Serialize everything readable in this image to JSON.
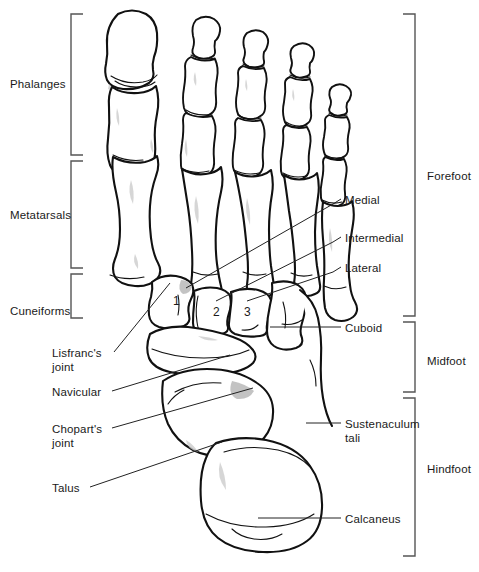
{
  "figure": {
    "view": "dorsal",
    "line_color": "#1a1a1a",
    "bone_fill": "#ffffff",
    "shading_color": "#b0b0b0",
    "background": "#ffffff"
  },
  "region_brackets_left": [
    {
      "label": "Phalanges",
      "name": "bracket-phalanges",
      "side": "left",
      "y_top": 14,
      "y_bottom": 155,
      "label_y": 78
    },
    {
      "label": "Metatarsals",
      "name": "bracket-metatarsals",
      "side": "left",
      "y_top": 161,
      "y_bottom": 268,
      "label_y": 209
    },
    {
      "label": "Cuneiforms",
      "name": "bracket-cuneiforms",
      "side": "left",
      "y_top": 274,
      "y_bottom": 318,
      "label_y": 305
    }
  ],
  "region_brackets_right": [
    {
      "label": "Forefoot",
      "name": "bracket-forefoot",
      "side": "right",
      "y_top": 14,
      "y_bottom": 316,
      "label_y": 170
    },
    {
      "label": "Midfoot",
      "name": "bracket-midfoot",
      "side": "right",
      "y_top": 322,
      "y_bottom": 392,
      "label_y": 355
    },
    {
      "label": "Hindfoot",
      "name": "bracket-hindfoot",
      "side": "right",
      "y_top": 398,
      "y_bottom": 556,
      "label_y": 463
    }
  ],
  "callouts_right": [
    {
      "label": "Medial",
      "name": "callout-medial",
      "text_x": 345,
      "text_y": 194,
      "leader": [
        [
          341,
          199
        ],
        [
          333,
          204
        ],
        [
          186,
          288
        ]
      ]
    },
    {
      "label": "Intermedial",
      "name": "callout-intermedial",
      "text_x": 345,
      "text_y": 232,
      "leader": [
        [
          341,
          237
        ],
        [
          333,
          242
        ],
        [
          216,
          301
        ]
      ]
    },
    {
      "label": "Lateral",
      "name": "callout-lateral",
      "text_x": 345,
      "text_y": 262,
      "leader": [
        [
          341,
          267
        ],
        [
          333,
          272
        ],
        [
          247,
          301
        ]
      ]
    },
    {
      "label": "Cuboid",
      "name": "callout-cuboid",
      "text_x": 345,
      "text_y": 322,
      "leader": [
        [
          341,
          327
        ],
        [
          270,
          327
        ]
      ]
    },
    {
      "label": "Sustenaculum\ntali",
      "name": "callout-sustenaculum-tali",
      "text_x": 345,
      "text_y": 418,
      "leader": [
        [
          341,
          423
        ],
        [
          306,
          423
        ]
      ]
    },
    {
      "label": "Calcaneus",
      "name": "callout-calcaneus",
      "text_x": 345,
      "text_y": 513,
      "leader": [
        [
          341,
          518
        ],
        [
          258,
          518
        ]
      ]
    }
  ],
  "callouts_left": [
    {
      "label": "Lisfranc's\njoint",
      "name": "callout-lisfrancs-joint",
      "text_x": 52,
      "text_y": 347,
      "leader": [
        [
          114,
          352
        ],
        [
          170,
          283
        ]
      ]
    },
    {
      "label": "Navicular",
      "name": "callout-navicular",
      "text_x": 52,
      "text_y": 386,
      "leader": [
        [
          112,
          391
        ],
        [
          230,
          355
        ]
      ]
    },
    {
      "label": "Chopart's\njoint",
      "name": "callout-choparts-joint",
      "text_x": 52,
      "text_y": 423,
      "leader": [
        [
          112,
          428
        ],
        [
          253,
          388
        ]
      ]
    },
    {
      "label": "Talus",
      "name": "callout-talus",
      "text_x": 52,
      "text_y": 482,
      "leader": [
        [
          90,
          487
        ],
        [
          222,
          442
        ]
      ]
    }
  ],
  "bone_numbers": [
    {
      "label": "1",
      "name": "cuneiform-number-1",
      "x": 173,
      "y": 301,
      "bone": "medial cuneiform"
    },
    {
      "label": "2",
      "name": "cuneiform-number-2",
      "x": 213,
      "y": 312,
      "bone": "intermediate cuneiform"
    },
    {
      "label": "3",
      "name": "cuneiform-number-3",
      "x": 244,
      "y": 312,
      "bone": "lateral cuneiform"
    }
  ]
}
